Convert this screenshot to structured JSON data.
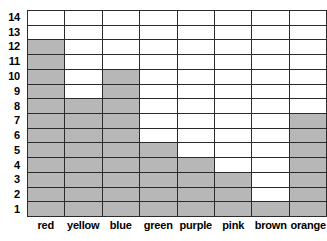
{
  "chart_data": {
    "type": "bar",
    "title": "",
    "subtitle": "",
    "xlabel": "",
    "ylabel": "",
    "orientation": "vertical",
    "grid": true,
    "legend": false,
    "categories": [
      "red",
      "yellow",
      "blue",
      "green",
      "purple",
      "pink",
      "brown",
      "orange"
    ],
    "values": [
      12,
      8,
      10,
      5,
      4,
      3,
      1,
      7
    ],
    "ylim": [
      0,
      14
    ],
    "ytick_labels": [
      "14",
      "13",
      "12",
      "11",
      "10",
      "9",
      "8",
      "7",
      "6",
      "5",
      "4",
      "3",
      "2",
      "1"
    ],
    "ytick_values": [
      14,
      13,
      12,
      11,
      10,
      9,
      8,
      7,
      6,
      5,
      4,
      3,
      2,
      1
    ],
    "rows": 14,
    "columns": 8
  },
  "style": {
    "filled_color": "#b7b7b7",
    "empty_color": "#ffffff",
    "grid_line_color": "#2b2b2b",
    "label_color": "#000000"
  }
}
